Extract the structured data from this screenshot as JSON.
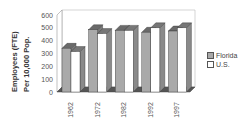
{
  "chart_data": {
    "type": "bar",
    "style": "3d-clustered-column",
    "title": "",
    "xlabel": "",
    "ylabel": "Employees (FTE) Per 10,000 Pop.",
    "ylabel_lines": [
      "Employees   (FTE)",
      "Per   10,000   Pop."
    ],
    "ylim": [
      0,
      600
    ],
    "yticks": [
      0,
      100,
      200,
      300,
      400,
      500,
      600
    ],
    "categories": [
      "1962",
      "1972",
      "1982",
      "1992",
      "1997"
    ],
    "series": [
      {
        "name": "Florida",
        "color": "#a9a9a9",
        "values": [
          340,
          485,
          480,
          465,
          475
        ]
      },
      {
        "name": "U.S.",
        "color": "#ffffff",
        "values": [
          315,
          455,
          480,
          500,
          500
        ]
      }
    ],
    "legend_position": "right",
    "grid": false
  }
}
